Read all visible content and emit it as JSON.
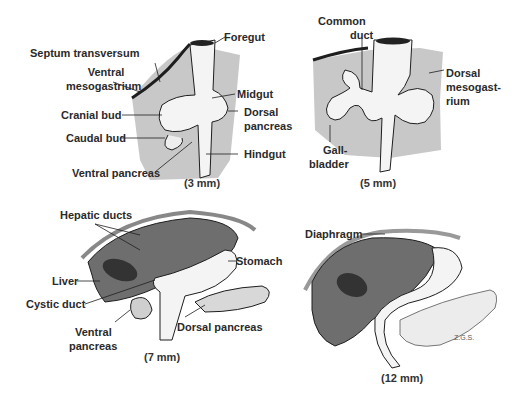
{
  "figure": {
    "colors": {
      "mesentery_gray": "#c8c8c8",
      "liver_dark": "#6e6e6e",
      "gallbladder": "#333333",
      "gut_white": "#f4f4f4",
      "outline": "#1e1e1e"
    },
    "panels": [
      {
        "id": "3mm",
        "caption": "(3 mm)",
        "labels": {
          "septum_transversum": "Septum transversum",
          "ventral_mesogastrium_1": "Ventral",
          "ventral_mesogastrium_2": "mesogastrium",
          "cranial_bud": "Cranial bud",
          "caudal_bud": "Caudal bud",
          "ventral_pancreas": "Ventral pancreas",
          "foregut": "Foregut",
          "midgut": "Midgut",
          "dorsal_pancreas_1": "Dorsal",
          "dorsal_pancreas_2": "pancreas",
          "hindgut": "Hindgut"
        }
      },
      {
        "id": "5mm",
        "caption": "(5 mm)",
        "labels": {
          "common_duct_1": "Common",
          "common_duct_2": "duct",
          "dorsal_mesogastrium_1": "Dorsal",
          "dorsal_mesogastrium_2": "mesogast-",
          "dorsal_mesogastrium_3": "rium",
          "gallbladder_1": "Gall-",
          "gallbladder_2": "bladder"
        }
      },
      {
        "id": "7mm",
        "caption": "(7 mm)",
        "labels": {
          "hepatic_ducts": "Hepatic ducts",
          "liver": "Liver",
          "cystic_duct": "Cystic duct",
          "ventral_pancreas_1": "Ventral",
          "ventral_pancreas_2": "pancreas",
          "stomach": "Stomach",
          "dorsal_pancreas": "Dorsal pancreas"
        }
      },
      {
        "id": "12mm",
        "caption": "(12 mm)",
        "labels": {
          "diaphragm": "Diaphragm"
        },
        "signature": "Z.G.S."
      }
    ]
  }
}
